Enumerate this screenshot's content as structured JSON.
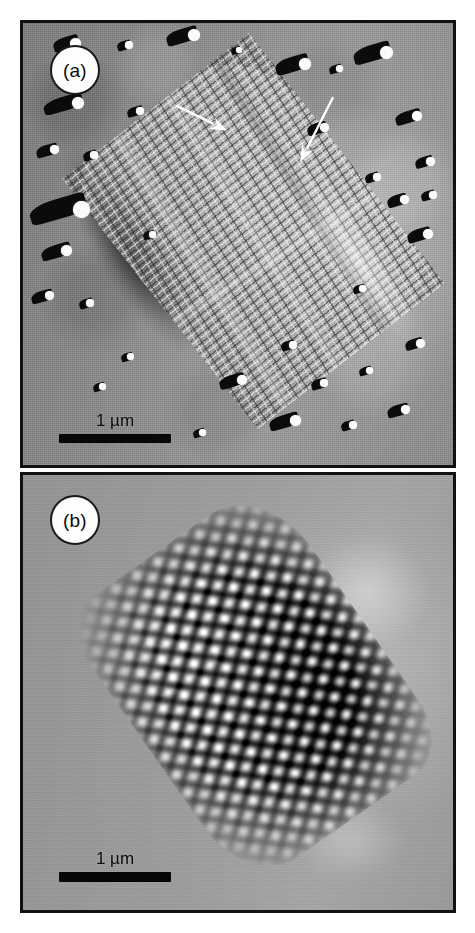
{
  "figure": {
    "type": "electron-micrograph-figure",
    "panel_count": 2,
    "background_color": "#ffffff",
    "border_color": "#111111"
  },
  "panels": [
    {
      "id": "a",
      "tag_label": "(a)",
      "description": "Shadowed replica electron micrograph of a crystalline lattice array with crosshatch striations",
      "background_tone": "#8d8d8d",
      "scalebar": {
        "label": "1 µm",
        "value": 1,
        "unit": "µm",
        "bar_color": "#070707",
        "bar_length_px": 112,
        "bar_thickness_px": 9
      },
      "annotations": [
        {
          "name": "arrow-upper-left",
          "kind": "arrow",
          "color": "#ffffff",
          "tail_x": 156,
          "tail_y": 84,
          "head_x": 207,
          "head_y": 109,
          "direction": "down-right"
        },
        {
          "name": "arrow-upper-right",
          "kind": "arrow",
          "color": "#ffffff",
          "tail_x": 314,
          "tail_y": 76,
          "head_x": 281,
          "head_y": 141,
          "direction": "down-left"
        }
      ]
    },
    {
      "id": "b",
      "tag_label": "(b)",
      "description": "Fourier filtered reconstruction of the same lattice showing high contrast crosshatch fringes",
      "background_tone": "#9b9b9b",
      "scalebar": {
        "label": "1 µm",
        "value": 1,
        "unit": "µm",
        "bar_color": "#070707",
        "bar_length_px": 112,
        "bar_thickness_px": 10
      },
      "annotations": []
    }
  ],
  "grains_panel_a": [
    {
      "x": 30,
      "y": 14,
      "w": 26,
      "h": 13,
      "hx": 17,
      "hy": 1,
      "hs": 11
    },
    {
      "x": 94,
      "y": 18,
      "w": 14,
      "h": 9,
      "hx": 8,
      "hy": 0,
      "hs": 8
    },
    {
      "x": 143,
      "y": 6,
      "w": 32,
      "h": 14,
      "hx": 22,
      "hy": 0,
      "hs": 12
    },
    {
      "x": 208,
      "y": 24,
      "w": 10,
      "h": 7,
      "hx": 5,
      "hy": 0,
      "hs": 6
    },
    {
      "x": 252,
      "y": 34,
      "w": 34,
      "h": 15,
      "hx": 24,
      "hy": 1,
      "hs": 12
    },
    {
      "x": 306,
      "y": 42,
      "w": 13,
      "h": 8,
      "hx": 7,
      "hy": 0,
      "hs": 7
    },
    {
      "x": 330,
      "y": 22,
      "w": 38,
      "h": 16,
      "hx": 27,
      "hy": 1,
      "hs": 13
    },
    {
      "x": 20,
      "y": 74,
      "w": 40,
      "h": 14,
      "hx": 29,
      "hy": 0,
      "hs": 12
    },
    {
      "x": 104,
      "y": 84,
      "w": 16,
      "h": 9,
      "hx": 9,
      "hy": 0,
      "hs": 8
    },
    {
      "x": 372,
      "y": 88,
      "w": 26,
      "h": 12,
      "hx": 17,
      "hy": 0,
      "hs": 10
    },
    {
      "x": 13,
      "y": 122,
      "w": 22,
      "h": 11,
      "hx": 14,
      "hy": 0,
      "hs": 9
    },
    {
      "x": 60,
      "y": 128,
      "w": 14,
      "h": 9,
      "hx": 7,
      "hy": 0,
      "hs": 8
    },
    {
      "x": 392,
      "y": 134,
      "w": 18,
      "h": 10,
      "hx": 11,
      "hy": 0,
      "hs": 9
    },
    {
      "x": 6,
      "y": 176,
      "w": 58,
      "h": 20,
      "hx": 44,
      "hy": 2,
      "hs": 17
    },
    {
      "x": 342,
      "y": 150,
      "w": 14,
      "h": 9,
      "hx": 8,
      "hy": 0,
      "hs": 8
    },
    {
      "x": 364,
      "y": 172,
      "w": 20,
      "h": 11,
      "hx": 13,
      "hy": 0,
      "hs": 9
    },
    {
      "x": 398,
      "y": 168,
      "w": 14,
      "h": 9,
      "hx": 8,
      "hy": 0,
      "hs": 8
    },
    {
      "x": 18,
      "y": 222,
      "w": 30,
      "h": 13,
      "hx": 20,
      "hy": 0,
      "hs": 11
    },
    {
      "x": 384,
      "y": 206,
      "w": 24,
      "h": 12,
      "hx": 16,
      "hy": 0,
      "hs": 10
    },
    {
      "x": 8,
      "y": 268,
      "w": 22,
      "h": 11,
      "hx": 14,
      "hy": 0,
      "hs": 9
    },
    {
      "x": 56,
      "y": 276,
      "w": 14,
      "h": 9,
      "hx": 7,
      "hy": 0,
      "hs": 8
    },
    {
      "x": 330,
      "y": 262,
      "w": 12,
      "h": 8,
      "hx": 6,
      "hy": 0,
      "hs": 7
    },
    {
      "x": 258,
      "y": 318,
      "w": 14,
      "h": 9,
      "hx": 8,
      "hy": 0,
      "hs": 8
    },
    {
      "x": 98,
      "y": 330,
      "w": 12,
      "h": 8,
      "hx": 6,
      "hy": 0,
      "hs": 7
    },
    {
      "x": 196,
      "y": 352,
      "w": 26,
      "h": 12,
      "hx": 18,
      "hy": 0,
      "hs": 10
    },
    {
      "x": 288,
      "y": 356,
      "w": 16,
      "h": 10,
      "hx": 9,
      "hy": 0,
      "hs": 8
    },
    {
      "x": 336,
      "y": 344,
      "w": 13,
      "h": 8,
      "hx": 7,
      "hy": 0,
      "hs": 7
    },
    {
      "x": 382,
      "y": 316,
      "w": 18,
      "h": 10,
      "hx": 11,
      "hy": 0,
      "hs": 9
    },
    {
      "x": 246,
      "y": 392,
      "w": 30,
      "h": 13,
      "hx": 21,
      "hy": 0,
      "hs": 11
    },
    {
      "x": 318,
      "y": 398,
      "w": 14,
      "h": 9,
      "hx": 8,
      "hy": 0,
      "hs": 8
    },
    {
      "x": 364,
      "y": 382,
      "w": 22,
      "h": 11,
      "hx": 14,
      "hy": 0,
      "hs": 9
    },
    {
      "x": 170,
      "y": 406,
      "w": 12,
      "h": 8,
      "hx": 6,
      "hy": 0,
      "hs": 7
    },
    {
      "x": 70,
      "y": 360,
      "w": 12,
      "h": 8,
      "hx": 6,
      "hy": 0,
      "hs": 7
    },
    {
      "x": 120,
      "y": 208,
      "w": 12,
      "h": 8,
      "hx": 6,
      "hy": 0,
      "hs": 7
    },
    {
      "x": 284,
      "y": 100,
      "w": 20,
      "h": 11,
      "hx": 13,
      "hy": 0,
      "hs": 9
    }
  ]
}
